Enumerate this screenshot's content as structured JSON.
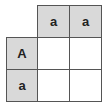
{
  "diagram": {
    "type": "young-tableau-skew-grid",
    "colors": {
      "shaded": "#d9d9d9",
      "blank": "#ffffff",
      "border": "#555555",
      "text": "#222222"
    },
    "cells": [
      {
        "row": 0,
        "col": 1,
        "label": "a",
        "shaded": true
      },
      {
        "row": 0,
        "col": 2,
        "label": "a",
        "shaded": true
      },
      {
        "row": 1,
        "col": 0,
        "label": "A",
        "shaded": true
      },
      {
        "row": 1,
        "col": 1,
        "label": "",
        "shaded": false
      },
      {
        "row": 1,
        "col": 2,
        "label": "",
        "shaded": false
      },
      {
        "row": 2,
        "col": 0,
        "label": "a",
        "shaded": true
      },
      {
        "row": 2,
        "col": 1,
        "label": "",
        "shaded": false
      },
      {
        "row": 2,
        "col": 2,
        "label": "",
        "shaded": false
      }
    ]
  }
}
